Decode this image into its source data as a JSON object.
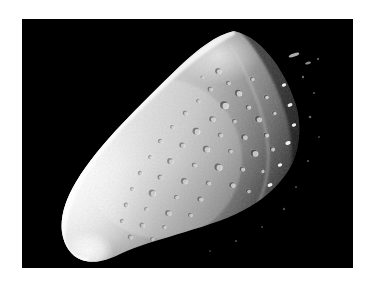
{
  "page": {
    "background_color": "#ffffff",
    "width": 374,
    "height": 286,
    "caption": "",
    "title": ""
  },
  "photo": {
    "frame": {
      "x": 22,
      "y": 19,
      "width": 331,
      "height": 249,
      "background_color": "#000000",
      "border_color": "#000000"
    },
    "subject": "asteroid",
    "subject_label": "asteroid-951-gaspra",
    "description": "Irregular elongated asteroid lit from the left, heavily cratered surface, terminator shadow on the right side against black space",
    "lighting": {
      "direction": "left",
      "highlight_color": "#fbfbfb",
      "midtone_color": "#b8b8b8",
      "shadow_color": "#141414",
      "space_color": "#000000"
    },
    "body_outline": [
      [
        212,
        12
      ],
      [
        228,
        18
      ],
      [
        243,
        30
      ],
      [
        255,
        45
      ],
      [
        265,
        60
      ],
      [
        272,
        76
      ],
      [
        276,
        92
      ],
      [
        278,
        108
      ],
      [
        276,
        124
      ],
      [
        270,
        140
      ],
      [
        260,
        156
      ],
      [
        246,
        170
      ],
      [
        230,
        182
      ],
      [
        212,
        192
      ],
      [
        192,
        200
      ],
      [
        170,
        208
      ],
      [
        148,
        214
      ],
      [
        126,
        220
      ],
      [
        106,
        228
      ],
      [
        90,
        236
      ],
      [
        76,
        242
      ],
      [
        64,
        242
      ],
      [
        52,
        236
      ],
      [
        44,
        226
      ],
      [
        40,
        212
      ],
      [
        42,
        196
      ],
      [
        48,
        180
      ],
      [
        58,
        163
      ],
      [
        70,
        147
      ],
      [
        84,
        131
      ],
      [
        98,
        116
      ],
      [
        112,
        102
      ],
      [
        126,
        88
      ],
      [
        140,
        74
      ],
      [
        154,
        60
      ],
      [
        168,
        46
      ],
      [
        182,
        32
      ],
      [
        196,
        20
      ]
    ],
    "bright_limb": {
      "note": "Smooth, blown-out white limb along the left and lower-left edge"
    },
    "terminator": {
      "note": "Right third of the body falls into shadow; isolated crater rims remain lit"
    },
    "craters": [
      {
        "cx": 196,
        "cy": 52,
        "r": 3.0,
        "b": 0.55
      },
      {
        "cx": 206,
        "cy": 64,
        "r": 2.2,
        "b": 0.5
      },
      {
        "cx": 188,
        "cy": 70,
        "r": 2.6,
        "b": 0.45
      },
      {
        "cx": 216,
        "cy": 74,
        "r": 3.4,
        "b": 0.6
      },
      {
        "cx": 176,
        "cy": 82,
        "r": 2.0,
        "b": 0.4
      },
      {
        "cx": 202,
        "cy": 86,
        "r": 4.0,
        "b": 0.62
      },
      {
        "cx": 226,
        "cy": 88,
        "r": 2.6,
        "b": 0.55
      },
      {
        "cx": 163,
        "cy": 94,
        "r": 2.4,
        "b": 0.42
      },
      {
        "cx": 190,
        "cy": 100,
        "r": 3.0,
        "b": 0.5
      },
      {
        "cx": 212,
        "cy": 102,
        "r": 2.2,
        "b": 0.48
      },
      {
        "cx": 236,
        "cy": 100,
        "r": 3.2,
        "b": 0.58
      },
      {
        "cx": 150,
        "cy": 108,
        "r": 2.0,
        "b": 0.4
      },
      {
        "cx": 174,
        "cy": 112,
        "r": 3.6,
        "b": 0.52
      },
      {
        "cx": 198,
        "cy": 116,
        "r": 2.4,
        "b": 0.46
      },
      {
        "cx": 222,
        "cy": 118,
        "r": 3.0,
        "b": 0.55
      },
      {
        "cx": 244,
        "cy": 116,
        "r": 2.6,
        "b": 0.6
      },
      {
        "cx": 138,
        "cy": 122,
        "r": 2.2,
        "b": 0.38
      },
      {
        "cx": 160,
        "cy": 126,
        "r": 2.8,
        "b": 0.45
      },
      {
        "cx": 184,
        "cy": 130,
        "r": 3.4,
        "b": 0.5
      },
      {
        "cx": 208,
        "cy": 132,
        "r": 2.2,
        "b": 0.5
      },
      {
        "cx": 232,
        "cy": 134,
        "r": 3.6,
        "b": 0.58
      },
      {
        "cx": 128,
        "cy": 138,
        "r": 2.0,
        "b": 0.36
      },
      {
        "cx": 148,
        "cy": 142,
        "r": 3.0,
        "b": 0.44
      },
      {
        "cx": 172,
        "cy": 146,
        "r": 2.4,
        "b": 0.46
      },
      {
        "cx": 196,
        "cy": 148,
        "r": 3.8,
        "b": 0.52
      },
      {
        "cx": 220,
        "cy": 150,
        "r": 2.6,
        "b": 0.55
      },
      {
        "cx": 118,
        "cy": 154,
        "r": 2.2,
        "b": 0.34
      },
      {
        "cx": 138,
        "cy": 158,
        "r": 2.6,
        "b": 0.42
      },
      {
        "cx": 162,
        "cy": 162,
        "r": 3.2,
        "b": 0.46
      },
      {
        "cx": 186,
        "cy": 164,
        "r": 2.4,
        "b": 0.48
      },
      {
        "cx": 210,
        "cy": 166,
        "r": 3.0,
        "b": 0.54
      },
      {
        "cx": 110,
        "cy": 170,
        "r": 2.0,
        "b": 0.33
      },
      {
        "cx": 130,
        "cy": 174,
        "r": 3.4,
        "b": 0.4
      },
      {
        "cx": 154,
        "cy": 178,
        "r": 2.2,
        "b": 0.44
      },
      {
        "cx": 178,
        "cy": 180,
        "r": 2.8,
        "b": 0.48
      },
      {
        "cx": 104,
        "cy": 186,
        "r": 2.4,
        "b": 0.32
      },
      {
        "cx": 124,
        "cy": 190,
        "r": 2.0,
        "b": 0.38
      },
      {
        "cx": 146,
        "cy": 194,
        "r": 3.0,
        "b": 0.44
      },
      {
        "cx": 168,
        "cy": 196,
        "r": 2.2,
        "b": 0.46
      },
      {
        "cx": 100,
        "cy": 202,
        "r": 2.2,
        "b": 0.3
      },
      {
        "cx": 120,
        "cy": 206,
        "r": 2.6,
        "b": 0.36
      },
      {
        "cx": 142,
        "cy": 208,
        "r": 2.0,
        "b": 0.42
      },
      {
        "cx": 108,
        "cy": 218,
        "r": 2.4,
        "b": 0.32
      },
      {
        "cx": 130,
        "cy": 220,
        "r": 2.0,
        "b": 0.38
      },
      {
        "cx": 180,
        "cy": 58,
        "r": 1.6,
        "b": 0.38
      },
      {
        "cx": 230,
        "cy": 60,
        "r": 2.0,
        "b": 0.6
      },
      {
        "cx": 244,
        "cy": 78,
        "r": 2.2,
        "b": 0.62
      },
      {
        "cx": 252,
        "cy": 94,
        "r": 2.0,
        "b": 0.6
      },
      {
        "cx": 250,
        "cy": 130,
        "r": 2.4,
        "b": 0.6
      },
      {
        "cx": 240,
        "cy": 152,
        "r": 2.0,
        "b": 0.58
      },
      {
        "cx": 226,
        "cy": 172,
        "r": 2.2,
        "b": 0.5
      }
    ],
    "shadow_specks": [
      {
        "cx": 258,
        "cy": 40,
        "r": 2.4
      },
      {
        "cx": 268,
        "cy": 46,
        "r": 1.6
      },
      {
        "cx": 276,
        "cy": 52,
        "r": 1.2
      },
      {
        "cx": 262,
        "cy": 66,
        "r": 2.0
      },
      {
        "cx": 274,
        "cy": 72,
        "r": 1.4
      },
      {
        "cx": 268,
        "cy": 86,
        "r": 2.2
      },
      {
        "cx": 280,
        "cy": 92,
        "r": 1.4
      },
      {
        "cx": 272,
        "cy": 106,
        "r": 2.0
      },
      {
        "cx": 284,
        "cy": 112,
        "r": 1.2
      },
      {
        "cx": 266,
        "cy": 124,
        "r": 2.4
      },
      {
        "cx": 278,
        "cy": 134,
        "r": 1.6
      },
      {
        "cx": 258,
        "cy": 146,
        "r": 2.0
      },
      {
        "cx": 270,
        "cy": 154,
        "r": 1.4
      },
      {
        "cx": 248,
        "cy": 166,
        "r": 2.2
      },
      {
        "cx": 258,
        "cy": 176,
        "r": 1.4
      },
      {
        "cx": 236,
        "cy": 186,
        "r": 2.0
      },
      {
        "cx": 244,
        "cy": 196,
        "r": 1.2
      },
      {
        "cx": 214,
        "cy": 200,
        "r": 1.8
      },
      {
        "cx": 196,
        "cy": 210,
        "r": 2.0
      },
      {
        "cx": 176,
        "cy": 218,
        "r": 1.6
      },
      {
        "cx": 158,
        "cy": 226,
        "r": 1.8
      },
      {
        "cx": 140,
        "cy": 232,
        "r": 1.4
      },
      {
        "cx": 122,
        "cy": 238,
        "r": 1.6
      }
    ]
  }
}
